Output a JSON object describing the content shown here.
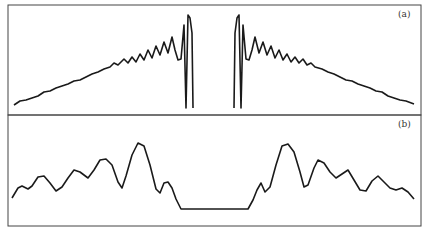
{
  "figure": {
    "panels": [
      {
        "id": "a",
        "label": "(a)",
        "description": "Spectrum rising with increasing oscillations toward a central gap, sharp double spikes at gap edges",
        "curve_left": [
          [
            14,
            105
          ],
          [
            20,
            101
          ],
          [
            26,
            100
          ],
          [
            32,
            98
          ],
          [
            38,
            96
          ],
          [
            44,
            92
          ],
          [
            50,
            91
          ],
          [
            56,
            88
          ],
          [
            62,
            86
          ],
          [
            68,
            84
          ],
          [
            74,
            81
          ],
          [
            80,
            80
          ],
          [
            86,
            77
          ],
          [
            92,
            74
          ],
          [
            98,
            72
          ],
          [
            104,
            69
          ],
          [
            110,
            67
          ],
          [
            114,
            63
          ],
          [
            118,
            65
          ],
          [
            124,
            59
          ],
          [
            128,
            63
          ],
          [
            132,
            57
          ],
          [
            136,
            62
          ],
          [
            140,
            54
          ],
          [
            144,
            60
          ],
          [
            148,
            50
          ],
          [
            152,
            58
          ],
          [
            156,
            46
          ],
          [
            160,
            55
          ],
          [
            164,
            42
          ],
          [
            168,
            53
          ],
          [
            172,
            37
          ],
          [
            175,
            50
          ],
          [
            178,
            60
          ],
          [
            181,
            59
          ],
          [
            184,
            25
          ],
          [
            186,
            108
          ],
          [
            188,
            15
          ],
          [
            190,
            18
          ],
          [
            192,
            33
          ],
          [
            193,
            108
          ]
        ],
        "curve_right": [
          [
            234,
            108
          ],
          [
            235,
            33
          ],
          [
            237,
            18
          ],
          [
            239,
            15
          ],
          [
            241,
            108
          ],
          [
            243,
            25
          ],
          [
            246,
            59
          ],
          [
            249,
            60
          ],
          [
            252,
            50
          ],
          [
            255,
            37
          ],
          [
            259,
            53
          ],
          [
            263,
            42
          ],
          [
            267,
            55
          ],
          [
            271,
            46
          ],
          [
            275,
            58
          ],
          [
            279,
            50
          ],
          [
            283,
            60
          ],
          [
            287,
            54
          ],
          [
            291,
            62
          ],
          [
            295,
            57
          ],
          [
            299,
            63
          ],
          [
            303,
            59
          ],
          [
            307,
            65
          ],
          [
            311,
            63
          ],
          [
            315,
            67
          ],
          [
            322,
            69
          ],
          [
            328,
            72
          ],
          [
            334,
            74
          ],
          [
            340,
            77
          ],
          [
            346,
            80
          ],
          [
            352,
            81
          ],
          [
            358,
            84
          ],
          [
            364,
            86
          ],
          [
            370,
            88
          ],
          [
            376,
            91
          ],
          [
            382,
            92
          ],
          [
            388,
            96
          ],
          [
            394,
            98
          ],
          [
            400,
            100
          ],
          [
            406,
            101
          ],
          [
            414,
            104
          ]
        ]
      },
      {
        "id": "b",
        "label": "(b)",
        "description": "Wavy profile with flat bottom plateau in center",
        "curve": [
          [
            12,
            198
          ],
          [
            18,
            188
          ],
          [
            22,
            186
          ],
          [
            28,
            189
          ],
          [
            32,
            186
          ],
          [
            38,
            177
          ],
          [
            44,
            176
          ],
          [
            50,
            183
          ],
          [
            56,
            191
          ],
          [
            62,
            187
          ],
          [
            68,
            178
          ],
          [
            74,
            170
          ],
          [
            80,
            172
          ],
          [
            88,
            178
          ],
          [
            94,
            170
          ],
          [
            100,
            160
          ],
          [
            106,
            159
          ],
          [
            112,
            165
          ],
          [
            118,
            182
          ],
          [
            122,
            188
          ],
          [
            126,
            176
          ],
          [
            132,
            155
          ],
          [
            138,
            143
          ],
          [
            144,
            146
          ],
          [
            150,
            165
          ],
          [
            156,
            189
          ],
          [
            160,
            193
          ],
          [
            164,
            183
          ],
          [
            168,
            182
          ],
          [
            172,
            188
          ],
          [
            176,
            199
          ],
          [
            181,
            209
          ],
          [
            248,
            209
          ],
          [
            253,
            200
          ],
          [
            257,
            190
          ],
          [
            261,
            183
          ],
          [
            265,
            192
          ],
          [
            270,
            187
          ],
          [
            276,
            165
          ],
          [
            282,
            146
          ],
          [
            288,
            144
          ],
          [
            294,
            152
          ],
          [
            300,
            172
          ],
          [
            304,
            187
          ],
          [
            308,
            185
          ],
          [
            314,
            168
          ],
          [
            318,
            160
          ],
          [
            324,
            163
          ],
          [
            330,
            172
          ],
          [
            336,
            178
          ],
          [
            342,
            174
          ],
          [
            348,
            170
          ],
          [
            354,
            180
          ],
          [
            360,
            190
          ],
          [
            366,
            191
          ],
          [
            372,
            181
          ],
          [
            378,
            176
          ],
          [
            384,
            182
          ],
          [
            390,
            188
          ],
          [
            396,
            190
          ],
          [
            402,
            188
          ],
          [
            408,
            192
          ],
          [
            414,
            199
          ]
        ]
      }
    ],
    "frame": {
      "left": 8,
      "right": 421,
      "top": 5,
      "divider": 115,
      "bottom": 226
    },
    "colors": {
      "line": "#1a1a1a",
      "frame": "#444444",
      "label": "#333333"
    }
  }
}
